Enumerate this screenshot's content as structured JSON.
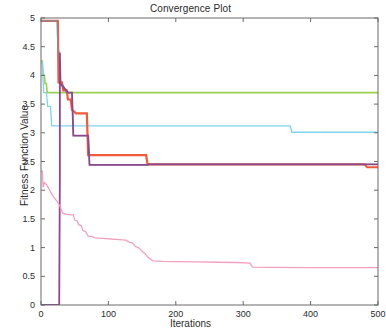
{
  "chart_data": {
    "type": "line",
    "title": "Convergence Plot",
    "xlabel": "Iterations",
    "ylabel": "Fitness Function Value",
    "xlim": [
      0,
      500
    ],
    "ylim": [
      0,
      5
    ],
    "grid": false,
    "legend": "none",
    "xticks": [
      0,
      100,
      200,
      300,
      400,
      500
    ],
    "xtick_labels": [
      "0",
      "100",
      "200",
      "300",
      "400",
      "500"
    ],
    "yticks": [
      0,
      0.5,
      1,
      1.5,
      2,
      2.5,
      3,
      3.5,
      4,
      4.5,
      5
    ],
    "ytick_labels": [
      "0",
      "0.5",
      "1",
      "1.5",
      "2",
      "2.5",
      "3",
      "3.5",
      "4",
      "4.5",
      "5"
    ],
    "series": [
      {
        "name": "green",
        "color": "#9bcf4e",
        "width": 1.6,
        "points": [
          [
            0,
            4.25
          ],
          [
            2,
            4.25
          ],
          [
            3,
            4.02
          ],
          [
            5,
            4.0
          ],
          [
            6,
            3.86
          ],
          [
            8,
            3.86
          ],
          [
            9,
            3.7
          ],
          [
            12,
            3.7
          ],
          [
            500,
            3.7
          ]
        ]
      },
      {
        "name": "cyan",
        "color": "#7fd4ee",
        "width": 1.3,
        "points": [
          [
            0,
            4.22
          ],
          [
            2,
            4.22
          ],
          [
            4,
            3.7
          ],
          [
            8,
            3.7
          ],
          [
            10,
            3.46
          ],
          [
            14,
            3.46
          ],
          [
            16,
            3.12
          ],
          [
            24,
            3.12
          ],
          [
            370,
            3.12
          ],
          [
            372,
            3.01
          ],
          [
            500,
            3.01
          ]
        ]
      },
      {
        "name": "red",
        "color": "#ef5c3c",
        "width": 2.2,
        "points": [
          [
            0,
            4.95
          ],
          [
            25,
            4.95
          ],
          [
            26,
            3.88
          ],
          [
            31,
            3.88
          ],
          [
            33,
            3.74
          ],
          [
            38,
            3.74
          ],
          [
            40,
            3.58
          ],
          [
            44,
            3.58
          ],
          [
            46,
            3.4
          ],
          [
            52,
            3.34
          ],
          [
            68,
            3.34
          ],
          [
            70,
            2.61
          ],
          [
            156,
            2.61
          ],
          [
            158,
            2.45
          ],
          [
            480,
            2.45
          ],
          [
            484,
            2.4
          ],
          [
            500,
            2.4
          ]
        ]
      },
      {
        "name": "gray-blue",
        "color": "#8a8a9e",
        "width": 1.3,
        "points": [
          [
            0,
            4.95
          ],
          [
            24,
            4.95
          ],
          [
            25,
            4.5
          ],
          [
            27,
            4.38
          ],
          [
            29,
            3.86
          ],
          [
            33,
            3.82
          ],
          [
            38,
            3.7
          ],
          [
            44,
            3.7
          ],
          [
            46,
            3.7
          ],
          [
            48,
            2.95
          ],
          [
            70,
            2.95
          ],
          [
            72,
            2.44
          ],
          [
            158,
            2.44
          ],
          [
            160,
            2.45
          ],
          [
            500,
            2.45
          ]
        ]
      },
      {
        "name": "purple",
        "color": "#8b4a8b",
        "width": 1.8,
        "points": [
          [
            0,
            0.0
          ],
          [
            27,
            0.0
          ],
          [
            28,
            2.3
          ],
          [
            28,
            4.4
          ],
          [
            29,
            3.86
          ],
          [
            33,
            3.8
          ],
          [
            40,
            3.7
          ],
          [
            46,
            3.7
          ],
          [
            48,
            2.95
          ],
          [
            70,
            2.95
          ],
          [
            72,
            2.44
          ],
          [
            158,
            2.44
          ],
          [
            160,
            2.45
          ],
          [
            500,
            2.45
          ]
        ]
      },
      {
        "name": "pink",
        "color": "#f2a0c0",
        "width": 1.3,
        "points": [
          [
            0,
            2.33
          ],
          [
            2,
            2.33
          ],
          [
            3,
            2.05
          ],
          [
            5,
            2.13
          ],
          [
            8,
            2.1
          ],
          [
            12,
            2.02
          ],
          [
            16,
            1.93
          ],
          [
            20,
            1.86
          ],
          [
            24,
            1.8
          ],
          [
            28,
            1.73
          ],
          [
            32,
            1.6
          ],
          [
            38,
            1.58
          ],
          [
            44,
            1.57
          ],
          [
            48,
            1.57
          ],
          [
            50,
            1.48
          ],
          [
            54,
            1.46
          ],
          [
            56,
            1.4
          ],
          [
            60,
            1.38
          ],
          [
            62,
            1.3
          ],
          [
            66,
            1.28
          ],
          [
            70,
            1.2
          ],
          [
            76,
            1.19
          ],
          [
            80,
            1.17
          ],
          [
            92,
            1.16
          ],
          [
            104,
            1.15
          ],
          [
            116,
            1.14
          ],
          [
            126,
            1.13
          ],
          [
            130,
            1.1
          ],
          [
            136,
            1.08
          ],
          [
            140,
            1.02
          ],
          [
            146,
            0.99
          ],
          [
            150,
            0.93
          ],
          [
            154,
            0.9
          ],
          [
            158,
            0.84
          ],
          [
            162,
            0.8
          ],
          [
            166,
            0.77
          ],
          [
            180,
            0.76
          ],
          [
            200,
            0.755
          ],
          [
            230,
            0.75
          ],
          [
            260,
            0.745
          ],
          [
            290,
            0.74
          ],
          [
            310,
            0.73
          ],
          [
            314,
            0.66
          ],
          [
            340,
            0.655
          ],
          [
            400,
            0.652
          ],
          [
            460,
            0.651
          ],
          [
            500,
            0.65
          ]
        ]
      }
    ]
  },
  "axes": {
    "frame_color": "#6b6b6b",
    "background": "#ffffff"
  }
}
